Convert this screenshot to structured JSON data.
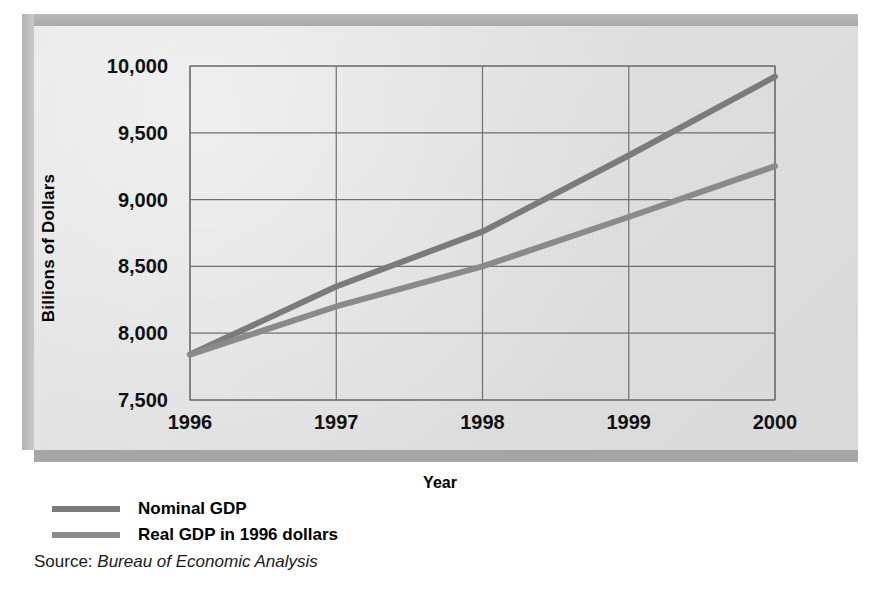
{
  "chart_data": {
    "type": "line",
    "title": "",
    "xlabel": "Year",
    "ylabel": "Billions of Dollars",
    "x": [
      1996,
      1997,
      1998,
      1999,
      2000
    ],
    "xtick_labels": [
      "1996",
      "1997",
      "1998",
      "1999",
      "2000"
    ],
    "ytick_labels": [
      "10,000",
      "9,500",
      "9,000",
      "8,500",
      "8,000",
      "7,500"
    ],
    "yticks": [
      10000,
      9500,
      9000,
      8500,
      8000,
      7500
    ],
    "ylim": [
      7500,
      10000
    ],
    "xlim": [
      1996,
      2000
    ],
    "grid": true,
    "legend_position": "below-plot-left",
    "series": [
      {
        "name": "Nominal GDP",
        "values": [
          7840,
          8350,
          8760,
          9330,
          9920
        ],
        "color": "#7b7b7b"
      },
      {
        "name": "Real GDP in 1996 dollars",
        "values": [
          7840,
          8200,
          8500,
          8870,
          9250
        ],
        "color": "#8a8a8a"
      }
    ]
  },
  "axes": {
    "y_title": "Billions of Dollars",
    "x_title": "Year"
  },
  "legend": {
    "items": [
      {
        "label": "Nominal GDP"
      },
      {
        "label": "Real GDP in 1996 dollars"
      }
    ]
  },
  "source": {
    "label": "Source:",
    "value": "Bureau of Economic Analysis"
  },
  "colors": {
    "line": "#7b7b7b",
    "grid": "#6f6f6f",
    "panel": "#e4e4e4",
    "frame_shadow": "#a6a6a6"
  }
}
